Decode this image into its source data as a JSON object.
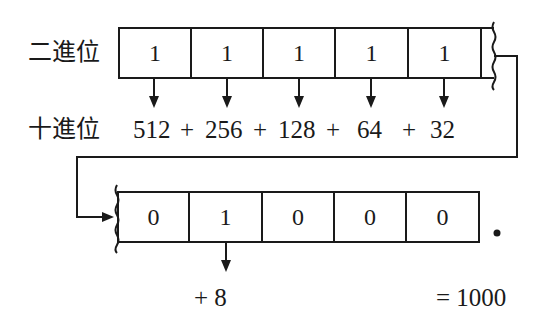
{
  "labels": {
    "binary": "二進位",
    "decimal": "十進位"
  },
  "top_row": {
    "bits": [
      "1",
      "1",
      "1",
      "1",
      "1"
    ],
    "terms": [
      "512",
      "+",
      "256",
      "+",
      "128",
      "+",
      "64",
      "+",
      "32"
    ]
  },
  "bottom_row": {
    "bits": [
      "0",
      "1",
      "0",
      "0",
      "0"
    ],
    "point": "•",
    "term": "+ 8",
    "result": "= 1000"
  }
}
